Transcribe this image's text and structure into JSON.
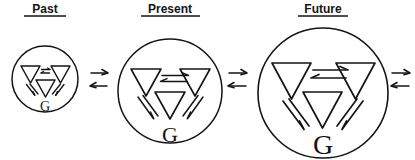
{
  "diagram": {
    "title_past": "Past",
    "title_present": "Present",
    "title_future": "Future",
    "g_label_past": "G",
    "g_label_present": "G",
    "g_label_future": "G",
    "ink_color": "#141414",
    "background_color": "#ffffff",
    "stages": [
      {
        "key": "past",
        "label": "Past",
        "circle": {
          "cx": 45,
          "cy": 79,
          "r": 33
        },
        "node_label": "G",
        "triangle_size": 19,
        "nodes": 3,
        "internal_link": "equilibrium-double-arrow"
      },
      {
        "key": "present",
        "label": "Present",
        "circle": {
          "cx": 170,
          "cy": 91,
          "r": 52
        },
        "node_label": "G",
        "triangle_size": 30,
        "nodes": 3,
        "internal_link": "equilibrium-double-arrow"
      },
      {
        "key": "future",
        "label": "Future",
        "circle": {
          "cx": 323,
          "cy": 93,
          "r": 65
        },
        "node_label": "G",
        "triangle_size": 39,
        "nodes": 3,
        "internal_link": "equilibrium-double-arrow"
      }
    ],
    "connectors": [
      {
        "key": "past-to-present",
        "x": 99,
        "y": 78,
        "type": "reversible-arrow-pair"
      },
      {
        "key": "present-to-future",
        "x": 238,
        "y": 78,
        "type": "reversible-arrow-pair"
      },
      {
        "key": "future-to-beyond",
        "x": 399,
        "y": 78,
        "type": "reversible-arrow-pair"
      }
    ]
  },
  "icons": {
    "triangle": "triangle-down-icon",
    "equilibrium": "equilibrium-arrow-icon",
    "arrow_right": "arrow-right-icon",
    "arrow_left": "arrow-left-icon",
    "circle": "circle-boundary-icon"
  }
}
